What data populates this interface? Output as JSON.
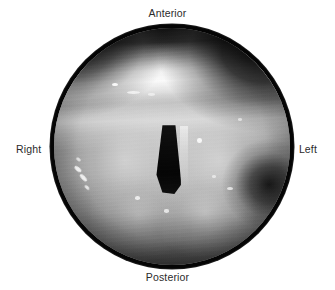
{
  "figure": {
    "kind": "endoscopic-photograph",
    "modality": "Laryngoscopy",
    "view_shape": "circular",
    "color_mode": "grayscale",
    "background_color": "#ffffff",
    "border_color": "#050505",
    "label_color": "#2b2b2b",
    "canvas": {
      "width": 335,
      "height": 290
    },
    "field": {
      "center_x": 172,
      "center_y": 146,
      "diameter": 237,
      "rim_width": 4
    }
  },
  "orientation_labels": {
    "top": "Anterior",
    "bottom": "Posterior",
    "left": "Right",
    "right": "Left"
  },
  "anatomy": {
    "glottic_opening": {
      "name": "glottic-opening",
      "description": "dark vertical airway slit",
      "shade": "#050505"
    },
    "bright_band": {
      "name": "specular-bright-band",
      "description": "bright horizontal highlight across superior field"
    },
    "right_recess": {
      "name": "piriform-recess-shadow",
      "description": "deep shadow pocket at right margin"
    }
  }
}
